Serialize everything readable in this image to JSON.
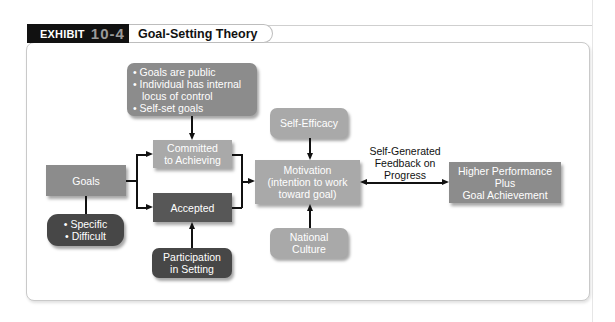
{
  "exhibit": {
    "label": "EXHIBIT",
    "number": "10-4",
    "title": "Goal-Setting Theory"
  },
  "nodes": {
    "commitment_factors": {
      "bullets": [
        "• Goals are public",
        "• Individual has internal",
        "   locus of control",
        "• Self-set goals"
      ]
    },
    "committed": {
      "lines": [
        "Committed",
        "to Achieving"
      ]
    },
    "goals": {
      "label": "Goals"
    },
    "accepted": {
      "label": "Accepted"
    },
    "goal_types": {
      "lines": [
        "• Specific",
        "• Difficult"
      ]
    },
    "participation": {
      "lines": [
        "Participation",
        "in Setting"
      ]
    },
    "self_efficacy": {
      "label": "Self-Efficacy"
    },
    "motivation": {
      "lines": [
        "Motivation",
        "(intention to work",
        "toward goal)"
      ]
    },
    "national_culture": {
      "lines": [
        "National",
        "Culture"
      ]
    },
    "outcome": {
      "lines": [
        "Higher Performance",
        "Plus",
        "Goal Achievement"
      ]
    }
  },
  "edges": {
    "feedback_label": [
      "Self-Generated",
      "Feedback on",
      "Progress"
    ]
  },
  "colors": {
    "header_black": "#111111",
    "box_mid": "#8c8c8c",
    "box_light": "#a9a9a9",
    "box_dark": "#575757"
  }
}
